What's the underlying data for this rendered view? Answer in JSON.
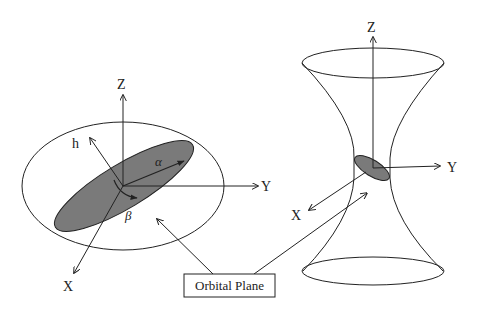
{
  "diagram": {
    "left_panel": {
      "description": "Orbital plane tilted within coordinate frame",
      "axes": {
        "z": "Z",
        "y": "Y",
        "x": "X"
      },
      "vectors": {
        "h": "h",
        "alpha": "α",
        "beta": "β"
      }
    },
    "right_panel": {
      "description": "Hyperboloid with small orbital plane at waist",
      "axes": {
        "z": "Z",
        "y": "Y",
        "x": "X"
      }
    },
    "callout": {
      "label": "Orbital Plane"
    },
    "colors": {
      "line": "#222222",
      "plane_fill": "#7a7a7a",
      "background": "#ffffff"
    }
  }
}
